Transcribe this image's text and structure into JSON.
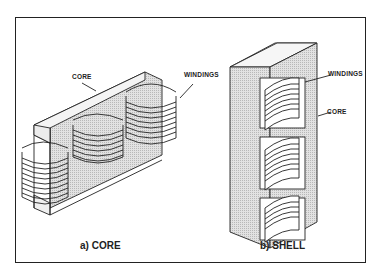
{
  "figure": {
    "panels": [
      {
        "caption": "a) CORE",
        "labels": {
          "core": "CORE",
          "windings": "WINDINGS"
        }
      },
      {
        "caption": "b) SHELL",
        "labels": {
          "windings": "WINDINGS",
          "core": "CORE"
        }
      }
    ],
    "colors": {
      "line": "#222222",
      "core_fill": "#d8d8d8",
      "background": "#ffffff"
    }
  }
}
